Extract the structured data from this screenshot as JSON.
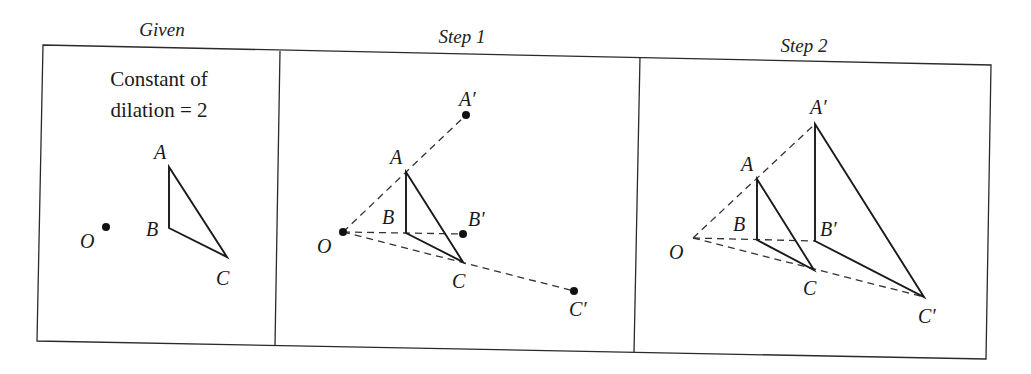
{
  "figure": {
    "panels": [
      {
        "id": "given",
        "title": "Given",
        "caption_line1": "Constant of",
        "caption_line2": "dilation = 2",
        "labels": {
          "O": "O",
          "A": "A",
          "B": "B",
          "C": "C"
        }
      },
      {
        "id": "step1",
        "title": "Step 1",
        "labels": {
          "O": "O",
          "A": "A",
          "B": "B",
          "C": "C",
          "A_prime": "A′",
          "B_prime": "B′",
          "C_prime": "C′"
        }
      },
      {
        "id": "step2",
        "title": "Step 2",
        "labels": {
          "O": "O",
          "A": "A",
          "B": "B",
          "C": "C",
          "A_prime": "A′",
          "B_prime": "B′",
          "C_prime": "C′"
        }
      }
    ],
    "dilation_constant": 2,
    "center_label": "O",
    "colors": {
      "ink": "#1a1a1a",
      "background": "#ffffff"
    }
  }
}
